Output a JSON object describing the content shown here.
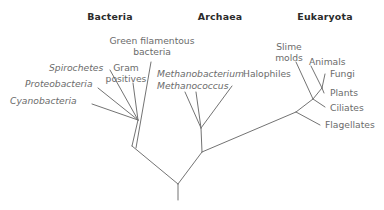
{
  "figure": {
    "type": "phylogenetic-tree",
    "line_color": "#737373",
    "label_color": "#6b6b6b",
    "heading_color": "#2b2b2b",
    "background": "#ffffff",
    "width": 384,
    "height": 210
  },
  "domains": [
    {
      "id": "bacteria",
      "label": "Bacteria",
      "x": 110,
      "y": 17
    },
    {
      "id": "archaea",
      "label": "Archaea",
      "x": 220,
      "y": 17
    },
    {
      "id": "eukaryota",
      "label": "Eukaryota",
      "x": 325,
      "y": 17
    }
  ],
  "taxa": [
    {
      "id": "cyanobacteria",
      "label": "Cyanobacteria",
      "domain": "bacteria",
      "italic": true,
      "align": "left",
      "x": 12,
      "y": 97
    },
    {
      "id": "proteobacteria",
      "label": "Proteobacteria",
      "domain": "bacteria",
      "italic": true,
      "align": "left",
      "x": 27,
      "y": 80
    },
    {
      "id": "spirochetes",
      "label": "Spirochetes",
      "domain": "bacteria",
      "italic": true,
      "align": "left",
      "x": 49,
      "y": 64
    },
    {
      "id": "gram-positives",
      "label": "Gram\npositives",
      "domain": "bacteria",
      "italic": false,
      "align": "center",
      "x": 113,
      "y": 64
    },
    {
      "id": "green-filamentous",
      "label": "Green filamentous\nbacteria",
      "domain": "bacteria",
      "italic": false,
      "align": "center",
      "x": 110,
      "y": 36
    },
    {
      "id": "methanobacterium",
      "label": "Methanobacterium",
      "domain": "archaea",
      "italic": true,
      "align": "left",
      "x": 158,
      "y": 70
    },
    {
      "id": "methanococcus",
      "label": "Methanococcus",
      "domain": "archaea",
      "italic": true,
      "align": "left",
      "x": 158,
      "y": 82
    },
    {
      "id": "halophiles",
      "label": "Halophiles",
      "domain": "archaea",
      "italic": false,
      "align": "left",
      "x": 243,
      "y": 70
    },
    {
      "id": "slime-molds",
      "label": "Slime\nmolds",
      "domain": "eukaryota",
      "italic": false,
      "align": "center",
      "x": 272,
      "y": 43
    },
    {
      "id": "animals",
      "label": "Animals",
      "domain": "eukaryota",
      "italic": false,
      "align": "left",
      "x": 309,
      "y": 58
    },
    {
      "id": "fungi",
      "label": "Fungi",
      "domain": "eukaryota",
      "italic": false,
      "align": "left",
      "x": 327,
      "y": 70
    },
    {
      "id": "plants",
      "label": "Plants",
      "domain": "eukaryota",
      "italic": false,
      "align": "left",
      "x": 327,
      "y": 89
    },
    {
      "id": "ciliates",
      "label": "Ciliates",
      "domain": "eukaryota",
      "italic": false,
      "align": "left",
      "x": 327,
      "y": 104
    },
    {
      "id": "flagellates",
      "label": "Flagellates",
      "domain": "eukaryota",
      "italic": false,
      "align": "left",
      "x": 322,
      "y": 121
    }
  ],
  "chart_data": {
    "type": "tree",
    "leaves": [
      "Cyanobacteria",
      "Proteobacteria",
      "Spirochetes",
      "Gram positives",
      "Green filamentous bacteria",
      "Methanobacterium",
      "Methanococcus",
      "Halophiles",
      "Slime molds",
      "Animals",
      "Fungi",
      "Plants",
      "Ciliates",
      "Flagellates"
    ],
    "groups": {
      "Bacteria": [
        "Cyanobacteria",
        "Proteobacteria",
        "Spirochetes",
        "Gram positives",
        "Green filamentous bacteria"
      ],
      "Archaea": [
        "Methanobacterium",
        "Methanococcus",
        "Halophiles"
      ],
      "Eukaryota": [
        "Slime molds",
        "Animals",
        "Fungi",
        "Plants",
        "Ciliates",
        "Flagellates"
      ]
    },
    "nodes": {
      "root": {
        "x": 178,
        "y": 184
      },
      "bacteria_node": {
        "x": 132,
        "y": 146
      },
      "archaea_euk_node": {
        "x": 202,
        "y": 152
      },
      "archaea_node": {
        "x": 201,
        "y": 128
      },
      "euk_node": {
        "x": 296,
        "y": 112
      },
      "euk_crown": {
        "x": 313,
        "y": 99
      },
      "animals_fungi": {
        "x": 322,
        "y": 88
      }
    },
    "edges": [
      {
        "from": "root",
        "to": "stem",
        "points": [
          [
            178,
            184
          ],
          [
            178,
            200
          ]
        ]
      },
      {
        "from": "root",
        "to": "bacteria_node",
        "points": [
          [
            178,
            184
          ],
          [
            132,
            146
          ]
        ]
      },
      {
        "from": "root",
        "to": "archaea_euk_node",
        "points": [
          [
            178,
            184
          ],
          [
            202,
            152
          ]
        ]
      },
      {
        "from": "bacteria_node",
        "to": "bacteria_crown",
        "points": [
          [
            132,
            146
          ],
          [
            138,
            120
          ]
        ]
      },
      {
        "from": "bacteria_crown",
        "to": "Cyanobacteria",
        "points": [
          [
            138,
            120
          ],
          [
            92,
            104
          ]
        ]
      },
      {
        "from": "bacteria_crown",
        "to": "Proteobacteria",
        "points": [
          [
            138,
            120
          ],
          [
            98,
            88
          ]
        ]
      },
      {
        "from": "bacteria_crown",
        "to": "Spirochetes",
        "points": [
          [
            138,
            120
          ],
          [
            110,
            70
          ]
        ]
      },
      {
        "from": "bacteria_crown",
        "to": "Gram positives",
        "points": [
          [
            138,
            120
          ],
          [
            133,
            83
          ]
        ]
      },
      {
        "from": "bacteria_node",
        "to": "Green filamentous bacteria",
        "points": [
          [
            136,
            148
          ],
          [
            151,
            62
          ]
        ]
      },
      {
        "from": "archaea_euk_node",
        "to": "archaea_node",
        "points": [
          [
            202,
            152
          ],
          [
            201,
            128
          ]
        ]
      },
      {
        "from": "archaea_node",
        "to": "Methanobacterium",
        "points": [
          [
            201,
            128
          ],
          [
            185,
            92
          ]
        ]
      },
      {
        "from": "archaea_node",
        "to": "Methanococcus",
        "points": [
          [
            201,
            128
          ],
          [
            196,
            92
          ]
        ]
      },
      {
        "from": "archaea_node",
        "to": "Halophiles",
        "points": [
          [
            201,
            128
          ],
          [
            232,
            86
          ]
        ]
      },
      {
        "from": "archaea_euk_node",
        "to": "euk_node",
        "points": [
          [
            202,
            152
          ],
          [
            296,
            112
          ]
        ]
      },
      {
        "from": "euk_node",
        "to": "Flagellates",
        "points": [
          [
            296,
            112
          ],
          [
            320,
            125
          ]
        ]
      },
      {
        "from": "euk_node",
        "to": "euk_crown",
        "points": [
          [
            296,
            112
          ],
          [
            313,
            99
          ]
        ]
      },
      {
        "from": "euk_crown",
        "to": "Ciliates",
        "points": [
          [
            313,
            99
          ],
          [
            325,
            107
          ]
        ]
      },
      {
        "from": "euk_crown",
        "to": "Slime molds",
        "points": [
          [
            313,
            99
          ],
          [
            296,
            62
          ]
        ]
      },
      {
        "from": "euk_crown",
        "to": "animals_fungi",
        "points": [
          [
            313,
            99
          ],
          [
            322,
            88
          ]
        ]
      },
      {
        "from": "animals_fungi",
        "to": "Plants",
        "points": [
          [
            322,
            88
          ],
          [
            324,
            93
          ]
        ]
      },
      {
        "from": "animals_fungi",
        "to": "Animals",
        "points": [
          [
            322,
            88
          ],
          [
            311,
            66
          ]
        ]
      },
      {
        "from": "animals_fungi",
        "to": "Fungi",
        "points": [
          [
            322,
            88
          ],
          [
            325,
            74
          ]
        ]
      }
    ]
  }
}
